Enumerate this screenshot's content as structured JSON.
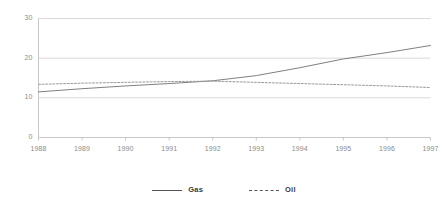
{
  "chart_data": {
    "type": "line",
    "title": "",
    "subtitle": "",
    "xlabel": "",
    "ylabel": "",
    "categories": [
      "1988",
      "1989",
      "1990",
      "1991",
      "1992",
      "1993",
      "1994",
      "1995",
      "1996",
      "1997"
    ],
    "x": [
      1988,
      1989,
      1990,
      1991,
      1992,
      1993,
      1994,
      1995,
      1996,
      1997
    ],
    "series": [
      {
        "name": "Gas",
        "style": "solid",
        "color": "#808080",
        "values": [
          11.5,
          12.3,
          13.0,
          13.6,
          14.3,
          15.6,
          17.6,
          19.8,
          21.4,
          23.2
        ]
      },
      {
        "name": "Oil",
        "style": "dashed",
        "color": "#9a9a9a",
        "values": [
          13.4,
          13.7,
          13.9,
          14.1,
          14.2,
          13.9,
          13.6,
          13.3,
          13.0,
          12.6
        ]
      }
    ],
    "ylim": [
      0,
      30
    ],
    "yticks": [
      0,
      10,
      20,
      30
    ],
    "ytick_labels": [
      "0",
      "10",
      "20",
      "30"
    ],
    "xlim": [
      1988,
      1997
    ],
    "grid": "horizontal",
    "legend_position": "bottom",
    "legend": [
      "Gas",
      "Oil"
    ],
    "axis_color": "#c8c8c8",
    "grid_color": "#d9d9d9",
    "tick_label_color": "#8c8c8c"
  }
}
